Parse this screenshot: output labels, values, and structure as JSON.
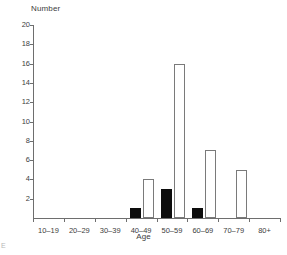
{
  "chart_data": {
    "type": "bar",
    "title": "",
    "xlabel": "Age",
    "ylabel": "Number",
    "categories": [
      "10–19",
      "20–29",
      "30–39",
      "40–49",
      "50–59",
      "60–69",
      "70–79",
      "80+"
    ],
    "series": [
      {
        "name": "filled",
        "style": "solid-black",
        "values": [
          0,
          0,
          0,
          1,
          3,
          1,
          0,
          0
        ]
      },
      {
        "name": "open",
        "style": "white-outline",
        "values": [
          0,
          0,
          0,
          4,
          16,
          7,
          5,
          0
        ]
      }
    ],
    "ylim": [
      0,
      20
    ],
    "ytick_labels": [
      "2",
      "4",
      "6",
      "8",
      "10",
      "12",
      "14",
      "16",
      "18",
      "20"
    ],
    "ytick_values": [
      2,
      4,
      6,
      8,
      10,
      12,
      14,
      16,
      18,
      20
    ],
    "ytick_step": 2,
    "grid": false,
    "legend": "none",
    "legend_position": "none",
    "axis_color": "#6e6e6e",
    "bar_fill_color": "#0d0d0d",
    "bar_open_fill": "#ffffff",
    "bar_outline_color": "#7a7a7a",
    "text_color": "#3d3d3d",
    "background": "#ffffff"
  },
  "figure": {
    "caption_artifact": "E"
  }
}
